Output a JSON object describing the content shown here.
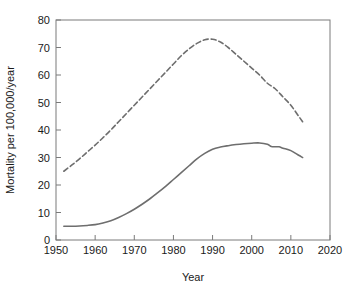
{
  "chart_data": {
    "type": "line",
    "title": "",
    "xlabel": "Year",
    "ylabel": "Mortality per 100,000/year",
    "xlim": [
      1950,
      2020
    ],
    "ylim": [
      0,
      80
    ],
    "xticks": [
      1950,
      1960,
      1970,
      1980,
      1990,
      2000,
      2010,
      2020
    ],
    "yticks": [
      0,
      10,
      20,
      30,
      40,
      50,
      60,
      70,
      80
    ],
    "grid": false,
    "legend": "none",
    "series": [
      {
        "name": "dashed-series",
        "style": "dashed",
        "color": "#6e6e6e",
        "x": [
          1952,
          1954,
          1956,
          1958,
          1960,
          1962,
          1964,
          1966,
          1968,
          1970,
          1972,
          1974,
          1976,
          1978,
          1980,
          1982,
          1984,
          1986,
          1988,
          1990,
          1992,
          1994,
          1996,
          1998,
          2000,
          2002,
          2004,
          2006,
          2008,
          2010,
          2012,
          2013
        ],
        "values": [
          25.0,
          27.2,
          29.5,
          32.0,
          34.5,
          37.2,
          40.0,
          43.0,
          46.0,
          49.0,
          52.0,
          55.0,
          58.0,
          61.0,
          64.0,
          67.0,
          69.5,
          71.5,
          72.8,
          73.0,
          72.0,
          70.0,
          67.5,
          65.0,
          62.5,
          60.0,
          57.0,
          55.0,
          52.0,
          49.0,
          45.0,
          43.0
        ]
      },
      {
        "name": "solid-series",
        "style": "solid",
        "color": "#6e6e6e",
        "x": [
          1952,
          1954,
          1956,
          1958,
          1960,
          1962,
          1964,
          1966,
          1968,
          1970,
          1972,
          1974,
          1976,
          1978,
          1980,
          1982,
          1984,
          1986,
          1988,
          1990,
          1992,
          1994,
          1996,
          1998,
          2000,
          2002,
          2004,
          2005,
          2006,
          2007,
          2008,
          2010,
          2012,
          2013
        ],
        "values": [
          5.0,
          5.0,
          5.1,
          5.3,
          5.6,
          6.2,
          7.0,
          8.2,
          9.6,
          11.2,
          13.0,
          15.0,
          17.2,
          19.5,
          22.0,
          24.5,
          27.0,
          29.5,
          31.5,
          33.0,
          33.8,
          34.3,
          34.7,
          35.0,
          35.2,
          35.3,
          34.8,
          34.0,
          33.9,
          33.9,
          33.4,
          32.5,
          30.8,
          30.0
        ]
      }
    ]
  },
  "axes": {
    "x_tick_labels": [
      "1950",
      "1960",
      "1970",
      "1980",
      "1990",
      "2000",
      "2010",
      "2020"
    ],
    "y_tick_labels": [
      "0",
      "10",
      "20",
      "30",
      "40",
      "50",
      "60",
      "70",
      "80"
    ],
    "x_axis_title": "Year",
    "y_axis_title": "Mortality per 100,000/year"
  }
}
